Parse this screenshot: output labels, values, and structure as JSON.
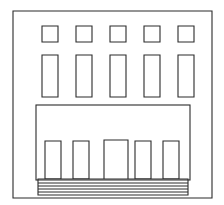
{
  "drawing": {
    "title": "Building Facade Line Drawing",
    "subject": "two-story building front elevation",
    "style": "black and white line art",
    "background_color": "#ffffff",
    "stroke_color": "#2b2b2b",
    "fill_color": "#ffffff"
  },
  "canvas": {
    "width": 224,
    "height": 205
  },
  "outer_wall": {
    "label": "building outer wall",
    "x": 13,
    "y": 11,
    "width": 199,
    "height": 187
  },
  "upper_floor": {
    "label": "upper floor facade",
    "rows": [
      {
        "row_name": "top-row-small-windows",
        "count": 5,
        "window_width": 16,
        "window_height": 16,
        "y": 26,
        "x_positions": [
          42,
          76,
          110,
          144,
          178
        ]
      },
      {
        "row_name": "middle-row-tall-windows",
        "count": 5,
        "window_width": 16,
        "window_height": 42,
        "y": 55,
        "x_positions": [
          42,
          76,
          110,
          144,
          178
        ]
      }
    ]
  },
  "ground_floor": {
    "label": "ground floor block",
    "block": {
      "x": 36,
      "y": 105,
      "width": 154,
      "height": 75
    },
    "windows": {
      "row_name": "ground-row-windows",
      "count": 4,
      "window_width": 16,
      "window_height": 38,
      "y": 141,
      "x_positions": [
        45,
        73,
        135,
        163
      ]
    },
    "door": {
      "label": "central entrance door",
      "x": 104,
      "y": 140,
      "width": 24,
      "height": 41
    }
  },
  "steps": {
    "label": "entrance steps",
    "count": 5,
    "x": 38,
    "width": 150,
    "y_positions": [
      180,
      183,
      186,
      189,
      192
    ],
    "bottom": 195
  }
}
